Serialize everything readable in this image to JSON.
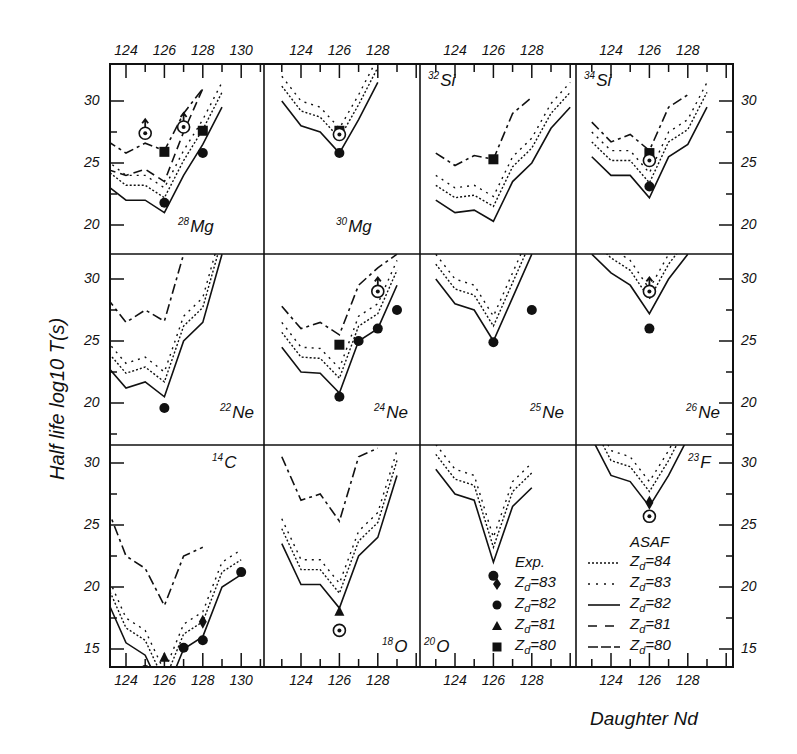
{
  "figure": {
    "ylabel": "Half life log10 T(s)",
    "xlabel": "Daughter Nd",
    "legend": {
      "exp_title": "Exp.",
      "asaf_title": "ASAF",
      "exp_entries": [
        {
          "marker": "diamond",
          "label": "Zd=83"
        },
        {
          "marker": "circle",
          "label": "Zd=82"
        },
        {
          "marker": "triangle",
          "label": "Zd=81"
        },
        {
          "marker": "square",
          "label": "Zd=80"
        }
      ],
      "asaf_entries": [
        {
          "style": "dense-dotted",
          "label": "Zd=84"
        },
        {
          "style": "sparse-dotted",
          "label": "Zd=83"
        },
        {
          "style": "solid",
          "label": "Zd=82"
        },
        {
          "style": "long-dash",
          "label": "Zd=81"
        },
        {
          "style": "dash-short",
          "label": "Zd=80"
        }
      ]
    }
  },
  "chart_data": {
    "type": "line",
    "title": "",
    "xlabel": "Daughter N_d",
    "ylabel": "Half life log10 T(s)",
    "layout": "4x3 panel grid, shared axes",
    "panels": [
      {
        "nucleus": "28Mg",
        "row": 0,
        "col": 0,
        "xticks": [
          124,
          126,
          128,
          130
        ],
        "ylim_hint": [
          17,
          32
        ],
        "series": [
          {
            "name": "Zd=82 ASAF",
            "x": [
              123,
              124,
              125,
              126,
              127,
              128,
              129
            ],
            "y": [
              23.2,
              22.0,
              22.0,
              21.0,
              24.0,
              26.5,
              29.5
            ]
          },
          {
            "name": "Zd=81 ASAF",
            "x": [
              123,
              124,
              125,
              126,
              127,
              128
            ],
            "y": [
              24.5,
              24.0,
              24.5,
              23.5,
              27.5,
              31.0
            ]
          },
          {
            "name": "Zd=80 ASAF",
            "x": [
              123,
              124,
              125,
              126,
              127,
              128
            ],
            "y": [
              26.8,
              25.8,
              26.6,
              26.0,
              29.0,
              31.0
            ]
          }
        ],
        "exp": [
          {
            "marker": "circle",
            "x": 126,
            "y": 21.8
          },
          {
            "marker": "circle",
            "x": 128,
            "y": 25.8
          },
          {
            "marker": "square",
            "x": 126,
            "y": 25.9
          },
          {
            "marker": "square",
            "x": 128,
            "y": 27.6
          },
          {
            "marker": "circle-open-lowerlimit",
            "x": 125,
            "y": 27.4
          },
          {
            "marker": "circle-open-lowerlimit",
            "x": 127,
            "y": 27.9
          }
        ]
      },
      {
        "nucleus": "30Mg",
        "row": 0,
        "col": 1,
        "xticks": [
          124,
          126,
          128
        ],
        "series": [
          {
            "name": "Zd=82 ASAF",
            "x": [
              123,
              124,
              125,
              126,
              127,
              128
            ],
            "y": [
              30.0,
              28.0,
              27.5,
              25.8,
              28.5,
              31.5
            ]
          }
        ],
        "exp": [
          {
            "marker": "circle",
            "x": 126,
            "y": 25.8
          },
          {
            "marker": "square",
            "x": 126,
            "y": 27.6
          },
          {
            "marker": "circle-open",
            "x": 126,
            "y": 27.3
          }
        ]
      },
      {
        "nucleus": "32Si",
        "row": 0,
        "col": 2,
        "xticks": [
          124,
          126,
          128
        ],
        "series": [
          {
            "name": "Zd=82 ASAF",
            "x": [
              123,
              124,
              125,
              126,
              127,
              128,
              129,
              130
            ],
            "y": [
              22.0,
              21.0,
              21.2,
              20.3,
              23.5,
              25.0,
              27.8,
              29.5
            ]
          },
          {
            "name": "Zd=80 ASAF",
            "x": [
              123,
              124,
              125,
              126,
              127,
              128
            ],
            "y": [
              25.8,
              24.8,
              25.6,
              25.3,
              29.0,
              30.3
            ]
          }
        ],
        "exp": [
          {
            "marker": "square",
            "x": 126,
            "y": 25.3
          }
        ]
      },
      {
        "nucleus": "34Si",
        "row": 0,
        "col": 3,
        "xticks": [
          124,
          126,
          128
        ],
        "series": [
          {
            "name": "Zd=82 ASAF",
            "x": [
              123,
              124,
              125,
              126,
              127,
              128,
              129
            ],
            "y": [
              25.5,
              24.0,
              24.0,
              22.2,
              25.5,
              26.5,
              29.5
            ]
          },
          {
            "name": "Zd=80 ASAF",
            "x": [
              123,
              124,
              125,
              126,
              127,
              128
            ],
            "y": [
              28.3,
              26.7,
              27.3,
              26.0,
              29.5,
              30.5
            ]
          }
        ],
        "exp": [
          {
            "marker": "circle",
            "x": 126,
            "y": 23.1
          },
          {
            "marker": "square",
            "x": 126,
            "y": 25.8
          },
          {
            "marker": "circle-open",
            "x": 126,
            "y": 25.2
          }
        ]
      },
      {
        "nucleus": "22Ne",
        "row": 1,
        "col": 0,
        "series": [
          {
            "name": "Zd=82 ASAF",
            "x": [
              123,
              124,
              125,
              126,
              127,
              128,
              129
            ],
            "y": [
              23.0,
              21.2,
              21.7,
              20.5,
              25.0,
              26.5,
              32.0
            ]
          },
          {
            "name": "Zd=80 ASAF",
            "x": [
              123,
              124,
              125,
              126,
              127
            ],
            "y": [
              28.5,
              26.5,
              27.5,
              26.6,
              32.0
            ]
          }
        ],
        "exp": [
          {
            "marker": "circle",
            "x": 126,
            "y": 19.6
          }
        ]
      },
      {
        "nucleus": "24Ne",
        "row": 1,
        "col": 1,
        "series": [
          {
            "name": "Zd=82 ASAF",
            "x": [
              123,
              124,
              125,
              126,
              127,
              128,
              129
            ],
            "y": [
              24.5,
              22.5,
              22.4,
              20.8,
              25.0,
              26.0,
              29.5
            ]
          },
          {
            "name": "Zd=80 ASAF",
            "x": [
              123,
              124,
              125,
              126,
              127,
              128,
              129
            ],
            "y": [
              27.8,
              26.0,
              26.5,
              25.5,
              29.5,
              30.9,
              32.0
            ]
          }
        ],
        "exp": [
          {
            "marker": "circle",
            "x": 126,
            "y": 20.5
          },
          {
            "marker": "circle",
            "x": 127,
            "y": 25.0
          },
          {
            "marker": "circle",
            "x": 128,
            "y": 26.0
          },
          {
            "marker": "circle",
            "x": 129,
            "y": 27.5
          },
          {
            "marker": "square",
            "x": 126,
            "y": 24.7
          },
          {
            "marker": "circle-open-lowerlimit",
            "x": 128,
            "y": 29.0
          }
        ]
      },
      {
        "nucleus": "25Ne",
        "row": 1,
        "col": 2,
        "series": [
          {
            "name": "Zd=82 ASAF",
            "x": [
              123,
              124,
              125,
              126,
              127,
              128
            ],
            "y": [
              30.0,
              28.0,
              27.5,
              25.0,
              28.5,
              32.0
            ]
          }
        ],
        "exp": [
          {
            "marker": "circle",
            "x": 126,
            "y": 24.9
          },
          {
            "marker": "circle",
            "x": 128,
            "y": 27.5
          }
        ]
      },
      {
        "nucleus": "26Ne",
        "row": 1,
        "col": 3,
        "series": [
          {
            "name": "Zd=82 ASAF",
            "x": [
              123,
              124,
              125,
              126,
              127,
              128
            ],
            "y": [
              32.0,
              30.5,
              29.5,
              27.2,
              30.0,
              32.0
            ]
          }
        ],
        "exp": [
          {
            "marker": "circle",
            "x": 126,
            "y": 26.0
          },
          {
            "marker": "circle-open-lowerlimit",
            "x": 126,
            "y": 29.0
          }
        ]
      },
      {
        "nucleus": "14C",
        "row": 2,
        "col": 0,
        "xticks": [
          124,
          126,
          128,
          130
        ],
        "series": [
          {
            "name": "Zd=82 ASAF",
            "x": [
              123,
              124,
              125,
              126,
              127,
              128,
              129,
              130
            ],
            "y": [
              19.0,
              15.5,
              14.5,
              11.2,
              15.0,
              16.0,
              20.0,
              21.0
            ]
          },
          {
            "name": "Zd=80 ASAF",
            "x": [
              123,
              124,
              125,
              126,
              127,
              128
            ],
            "y": [
              26.5,
              22.5,
              21.5,
              18.5,
              22.5,
              23.2
            ]
          }
        ],
        "exp": [
          {
            "marker": "circle",
            "x": 125,
            "y": 13.3
          },
          {
            "marker": "circle",
            "x": 126,
            "y": 11.0
          },
          {
            "marker": "circle",
            "x": 127,
            "y": 15.1
          },
          {
            "marker": "circle",
            "x": 128,
            "y": 15.7
          },
          {
            "marker": "circle",
            "x": 130,
            "y": 21.2
          },
          {
            "marker": "triangle",
            "x": 126,
            "y": 14.3
          },
          {
            "marker": "diamond",
            "x": 128,
            "y": 17.2
          }
        ]
      },
      {
        "nucleus": "18O",
        "row": 2,
        "col": 1,
        "xticks": [
          124,
          126,
          128
        ],
        "series": [
          {
            "name": "Zd=82 ASAF",
            "x": [
              123,
              124,
              125,
              126,
              127,
              128,
              129
            ],
            "y": [
              23.5,
              20.2,
              20.2,
              18.3,
              22.5,
              24.0,
              29.0
            ]
          },
          {
            "name": "Zd=80 ASAF",
            "x": [
              123,
              124,
              125,
              126,
              127,
              128
            ],
            "y": [
              30.5,
              27.0,
              27.5,
              25.3,
              30.5,
              31.2
            ]
          }
        ],
        "exp": [
          {
            "marker": "triangle",
            "x": 126,
            "y": 18.0
          },
          {
            "marker": "circle-open",
            "x": 126,
            "y": 16.5
          }
        ]
      },
      {
        "nucleus": "20O",
        "row": 2,
        "col": 2,
        "xticks": [
          124,
          126,
          128
        ],
        "series": [
          {
            "name": "Zd=82 ASAF",
            "x": [
              123,
              124,
              125,
              126,
              127,
              128
            ],
            "y": [
              29.5,
              27.5,
              27.0,
              22.0,
              26.5,
              28.0
            ]
          }
        ],
        "exp": [
          {
            "marker": "circle",
            "x": 126,
            "y": 20.9
          }
        ]
      },
      {
        "nucleus": "23F",
        "row": 2,
        "col": 3,
        "xticks": [
          124,
          126,
          128
        ],
        "series": [
          {
            "name": "Zd=82 ASAF",
            "x": [
              123,
              124,
              125,
              126,
              127,
              128
            ],
            "y": [
              32.0,
              29.0,
              28.5,
              26.5,
              29.0,
              32.0
            ]
          }
        ],
        "exp": [
          {
            "marker": "diamond",
            "x": 126,
            "y": 26.8
          },
          {
            "marker": "circle-open",
            "x": 126,
            "y": 25.7
          }
        ]
      }
    ],
    "y_ticks": [
      10,
      15,
      20,
      25,
      30
    ],
    "x_ticks": [
      124,
      126,
      128,
      130
    ],
    "grid": false,
    "legend_position": "lower right panels"
  }
}
